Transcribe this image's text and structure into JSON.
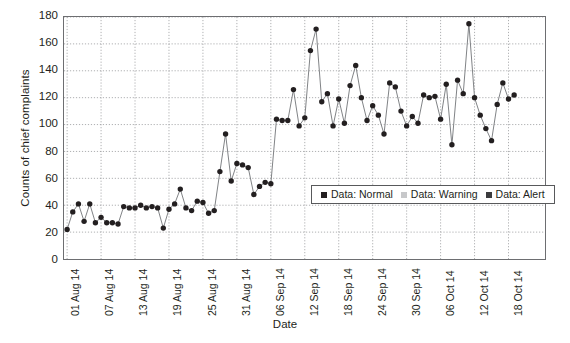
{
  "chart_data": {
    "type": "line",
    "title": "",
    "xlabel": "Date",
    "ylabel": "Counts of chief complaints",
    "ylim": [
      0,
      180
    ],
    "ytick_values": [
      0,
      20,
      40,
      60,
      80,
      100,
      120,
      140,
      160,
      180
    ],
    "ytick_labels": [
      "0",
      "20",
      "40",
      "60",
      "80",
      "100",
      "120",
      "140",
      "160",
      "180"
    ],
    "grid": true,
    "legend_position": "inside-right",
    "legend": [
      {
        "label": "Data: Normal",
        "color": "#231f20"
      },
      {
        "label": "Data: Warning",
        "color": "#c7c8ca"
      },
      {
        "label": "Data: Alert",
        "color": "#3b3b3d"
      }
    ],
    "xtick_labels": [
      "01 Aug 14",
      "07 Aug 14",
      "13 Aug 14",
      "19 Aug 14",
      "25 Aug 14",
      "31 Aug 14",
      "06 Sep 14",
      "12 Sep 14",
      "18 Sep 14",
      "24 Sep 14",
      "30 Sep 14",
      "06 Oct 14",
      "12 Oct 14",
      "18 Oct 14"
    ],
    "xtick_indices": [
      0,
      6,
      12,
      18,
      24,
      30,
      36,
      42,
      48,
      54,
      60,
      66,
      72,
      78
    ],
    "x_start_date": "01 Aug 14",
    "n_points": 85,
    "series": [
      {
        "name": "Data: Normal",
        "color": "#231f20",
        "marker": "circle",
        "values": [
          22,
          35,
          41,
          28,
          41,
          27,
          31,
          27,
          27,
          26,
          39,
          38,
          38,
          40,
          38,
          39,
          38,
          23,
          37,
          41,
          52,
          38,
          36,
          43,
          42,
          34,
          36,
          65,
          93,
          58,
          71,
          70,
          68,
          48,
          54,
          57,
          56,
          104,
          103,
          103,
          126,
          99,
          105,
          155,
          171,
          117,
          123,
          99,
          119,
          101,
          129,
          144,
          120,
          103,
          114,
          107,
          93,
          131,
          128,
          110,
          99,
          106,
          101,
          122,
          120,
          121,
          104,
          130,
          85,
          133,
          123,
          175,
          120,
          107,
          97,
          88,
          115,
          131,
          119,
          122
        ]
      }
    ]
  }
}
